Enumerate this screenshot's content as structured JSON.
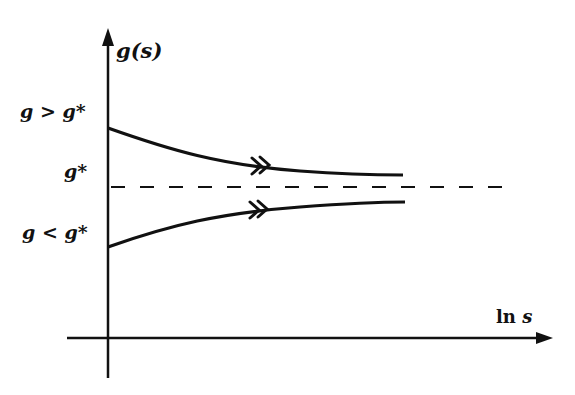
{
  "diagram": {
    "type": "renormalization-group flow diagram",
    "y_axis_label": "g(s)",
    "x_axis_label_prefix": "ln ",
    "x_axis_label_var": "s",
    "labels": {
      "above_fixed_point": "g > g*",
      "fixed_point": "g*",
      "below_fixed_point": "g < g*"
    },
    "curves": [
      {
        "name": "upper-flow",
        "description": "starts at g > g*, decreases toward g*",
        "arrow": "double"
      },
      {
        "name": "lower-flow",
        "description": "starts at g < g*, increases toward g*",
        "arrow": "double"
      }
    ],
    "fixed_point_line": "dashed horizontal line at g*",
    "colors": {
      "ink": "#111111",
      "background": "#ffffff"
    }
  }
}
